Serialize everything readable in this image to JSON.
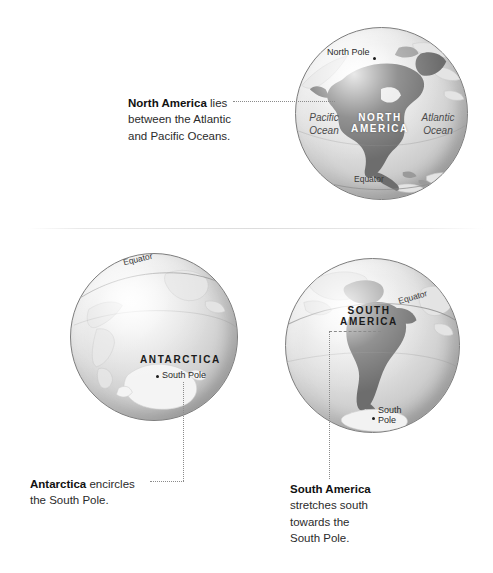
{
  "page": {
    "background": "#ffffff"
  },
  "panels": [
    {
      "id": "north-america",
      "globe": {
        "labels": {
          "pole": "North Pole",
          "continent": "NORTH\nAMERICA",
          "continent_line1": "NORTH",
          "continent_line2": "AMERICA",
          "ocean_left_line1": "Pacific",
          "ocean_left_line2": "Ocean",
          "ocean_right_line1": "Atlantic",
          "ocean_right_line2": "Ocean",
          "equator": "Equator"
        }
      },
      "caption": {
        "bold": "North America",
        "rest_line1": " lies",
        "line2": "between the Atlantic",
        "line3": "and Pacific Oceans."
      }
    },
    {
      "id": "antarctica",
      "globe": {
        "labels": {
          "equator": "Equator",
          "continent": "ANTARCTICA",
          "pole": "South Pole"
        }
      },
      "caption": {
        "bold": "Antarctica",
        "rest_line1": " encircles",
        "line2": "the South Pole."
      }
    },
    {
      "id": "south-america",
      "globe": {
        "labels": {
          "equator": "Equator",
          "continent_line1": "SOUTH",
          "continent_line2": "AMERICA",
          "pole_line1": "South",
          "pole_line2": "Pole"
        }
      },
      "caption": {
        "bold": "South America",
        "line2": "stretches south",
        "line3": "towards the",
        "line4": "South Pole."
      }
    }
  ],
  "colors": {
    "land_dark": "#6d6d6d",
    "land_mid": "#9a9a9a",
    "land_pale": "#e4e4e4",
    "globe_edge": "#7d7d7d",
    "leader": "#8b8b8b",
    "text": "#2b2b2b"
  }
}
